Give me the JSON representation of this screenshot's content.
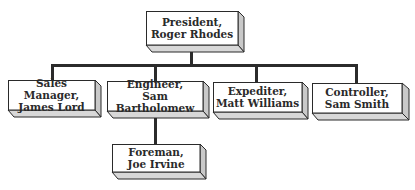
{
  "diagram": {
    "type": "org-chart",
    "root": {
      "title": "President,",
      "name": "Roger Rhodes"
    },
    "children": [
      {
        "title": "Sales Manager,",
        "name": "James Lord"
      },
      {
        "title": "Engineer,",
        "name": "Sam Bartholomew",
        "children": [
          {
            "title": "Foreman,",
            "name": "Joe Irvine"
          }
        ]
      },
      {
        "title": "Expediter,",
        "name": "Matt Williams"
      },
      {
        "title": "Controller,",
        "name": "Sam Smith"
      }
    ]
  },
  "colors": {
    "box_face": "#ffffff",
    "box_side": "#c9c9c9",
    "box_bottom": "#d8d8d8",
    "box_border": "#2a2a2a",
    "connector": "#2b2b2b"
  }
}
